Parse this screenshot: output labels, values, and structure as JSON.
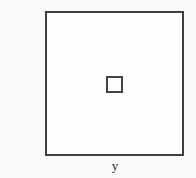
{
  "figure": {
    "type": "diagram",
    "background_color": "#f9f9f9",
    "outer_rectangle": {
      "name": "outer boundary rectangle",
      "stroke_color": "#3f3f3f",
      "fill_color": "#fdfdfd",
      "stroke_width_px": 2,
      "x": 45,
      "y": 11,
      "width": 139,
      "height": 145
    },
    "inner_square": {
      "name": "inner small square",
      "stroke_color": "#444444",
      "fill_color": "#fdfdfd",
      "stroke_width_px": 2,
      "x": 106,
      "y": 76,
      "width": 17,
      "height": 17
    },
    "labels": {
      "bottom_label": "y"
    }
  }
}
